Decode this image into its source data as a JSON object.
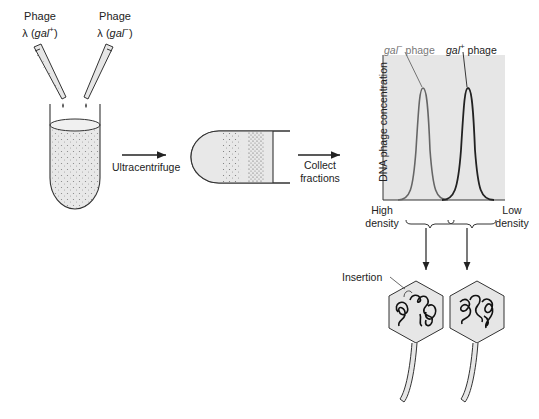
{
  "pipettes": [
    {
      "label_line1": "Phage",
      "label_prefix": "λ (",
      "gene": "gal",
      "sup": "+",
      "suffix": ")"
    },
    {
      "label_line1": "Phage",
      "label_prefix": "λ (",
      "gene": "gal",
      "sup": "−",
      "suffix": ")"
    }
  ],
  "steps": {
    "ultracentrifuge": "Ultracentrifuge",
    "collect_line1": "Collect",
    "collect_line2": "fractions"
  },
  "graph": {
    "ylabel": "DNA phage concentration",
    "peak_left": {
      "gene": "gal",
      "sup": "−",
      "text": " phage"
    },
    "peak_right": {
      "gene": "gal",
      "sup": "+",
      "text": " phage"
    },
    "x_left_line1": "High",
    "x_left_line2": "density",
    "x_right_line1": "Low",
    "x_right_line2": "density"
  },
  "phages": {
    "insertion_label": "Insertion"
  },
  "colors": {
    "fill_gray": "#e6e6e6",
    "line_dark": "#222222",
    "line_gray": "#666666"
  }
}
